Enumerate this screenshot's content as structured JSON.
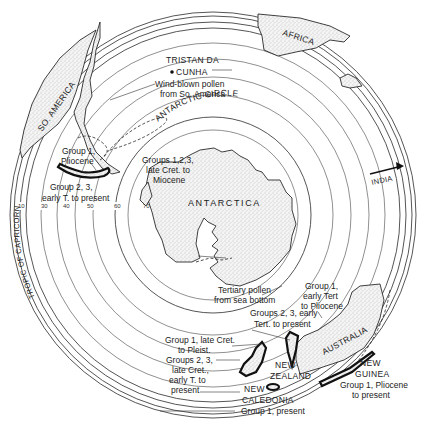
{
  "map": {
    "type": "polar-projection-southern-hemisphere",
    "center": [
      213,
      215
    ],
    "latitude_ticks": [
      "10",
      "30",
      "40",
      "50",
      "60",
      "70"
    ],
    "landmasses": [
      {
        "id": "antarctica",
        "label": "ANTARCTICA"
      },
      {
        "id": "south-america",
        "label": "SO. AMERICA"
      },
      {
        "id": "africa",
        "label": "AFRICA"
      },
      {
        "id": "australia",
        "label": "AUSTRALIA"
      },
      {
        "id": "new-zealand",
        "label": "NEW ZEALAND",
        "label_lines": [
          "NEW",
          "ZEALAND"
        ]
      },
      {
        "id": "new-caledonia",
        "label": "NEW CALEDONIA",
        "label_lines": [
          "NEW",
          "CALEDONIA"
        ]
      },
      {
        "id": "new-guinea",
        "label": "NEW GUINEA",
        "label_lines": [
          "NEW",
          "GUINEA"
        ]
      },
      {
        "id": "india",
        "label": "INDIA"
      }
    ],
    "reference_lines": {
      "antarctic_circle": "ANTARCTIC CIRCLE",
      "tropic_of_capricorn": "TROPIC OF CAPRICORN"
    },
    "places": {
      "tristan_line1": "TRISTAN DA",
      "tristan_line2": "CUNHA"
    },
    "annotations": {
      "wind_pollen_1": "Wind-blown pollen",
      "wind_pollen_2": "from So. America",
      "sa_group1_1": "Group 1,",
      "sa_group1_2": "Pliocene",
      "sa_group23_1": "Group 2, 3,",
      "sa_group23_2": "early T. to present",
      "ant_groups_1": "Groups 1,2,3,",
      "ant_groups_2": "late Cret. to",
      "ant_groups_3": "Miocene",
      "tertiary_1": "Tertiary pollen",
      "tertiary_2": "from sea bottom",
      "aus_group1_1": "Group 1,",
      "aus_group1_2": "early Tert",
      "aus_group1_3": "to Pliocene",
      "aus_group23_1": "Groups 2, 3, early",
      "aus_group23_2": "Tert. to present",
      "nz_group1_1": "Group 1, late Cret.",
      "nz_group1_2": "to Pleist.",
      "nz_group23_1": "Groups 2, 3,",
      "nz_group23_2": "late Cret.,",
      "nz_group23_3": "early T. to",
      "nz_group23_4": "present",
      "nc_group1": "Group 1, present",
      "ng_group1_1": "Group 1, Pliocene",
      "ng_group1_2": "to present"
    }
  }
}
